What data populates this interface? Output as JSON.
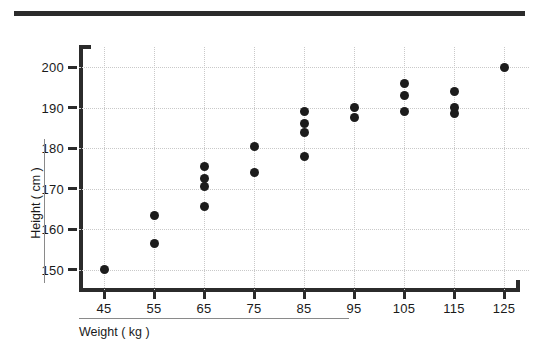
{
  "chart_data": {
    "type": "scatter",
    "title": "",
    "xlabel": "Weight ( kg )",
    "ylabel": "Height ( cm )",
    "xlim": [
      40,
      130
    ],
    "ylim": [
      145,
      205
    ],
    "xticks": [
      45,
      55,
      65,
      75,
      85,
      95,
      105,
      115,
      125
    ],
    "yticks": [
      150,
      160,
      170,
      180,
      190,
      200
    ],
    "grid": true,
    "legend": false,
    "marker_color": "#1c1c1c",
    "grid_color": "#c9c9c9",
    "axis_color": "#2b2b2b",
    "points": [
      {
        "x": 45,
        "y": 150
      },
      {
        "x": 55,
        "y": 163.5
      },
      {
        "x": 55,
        "y": 156.5
      },
      {
        "x": 65,
        "y": 175.5
      },
      {
        "x": 65,
        "y": 172.5
      },
      {
        "x": 65,
        "y": 170.5
      },
      {
        "x": 65,
        "y": 165.5
      },
      {
        "x": 75,
        "y": 180.5
      },
      {
        "x": 75,
        "y": 174
      },
      {
        "x": 85,
        "y": 189
      },
      {
        "x": 85,
        "y": 186
      },
      {
        "x": 85,
        "y": 184
      },
      {
        "x": 85,
        "y": 178
      },
      {
        "x": 95,
        "y": 190
      },
      {
        "x": 95,
        "y": 187.5
      },
      {
        "x": 105,
        "y": 196
      },
      {
        "x": 105,
        "y": 193
      },
      {
        "x": 105,
        "y": 189
      },
      {
        "x": 115,
        "y": 194
      },
      {
        "x": 115,
        "y": 190
      },
      {
        "x": 115,
        "y": 188.5
      },
      {
        "x": 125,
        "y": 200
      }
    ]
  },
  "xtick_labels": [
    "45",
    "55",
    "65",
    "75",
    "85",
    "95",
    "105",
    "115",
    "125"
  ],
  "ytick_labels": [
    "150",
    "160",
    "170",
    "180",
    "190",
    "200"
  ]
}
